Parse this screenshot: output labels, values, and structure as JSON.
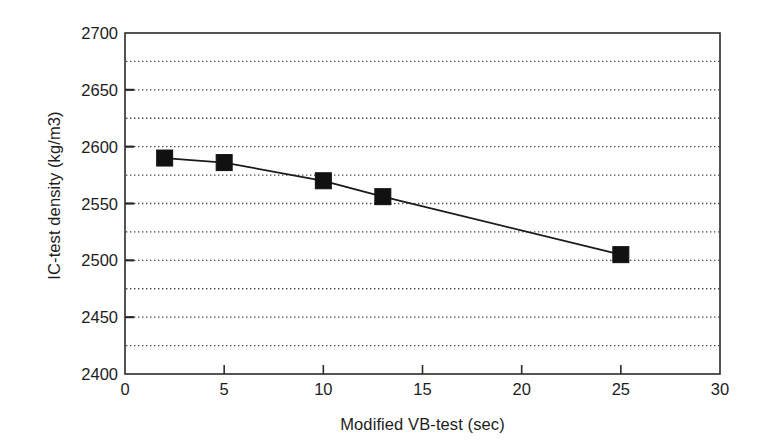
{
  "chart_data": {
    "type": "line",
    "title": "",
    "subtitle": "",
    "xlabel": "Modified VB-test (sec)",
    "ylabel": "IC-test density (kg/m3)",
    "xlim": [
      0,
      30
    ],
    "ylim": [
      2400,
      2700
    ],
    "x_ticks": [
      0,
      5,
      10,
      15,
      20,
      25,
      30
    ],
    "y_ticks": [
      2400,
      2450,
      2500,
      2550,
      2600,
      2650,
      2700
    ],
    "y_minor_gridlines": [
      2425,
      2450,
      2475,
      2500,
      2525,
      2550,
      2575,
      2600,
      2625,
      2650,
      2675
    ],
    "grid": "horizontal-dotted",
    "legend": "none",
    "marker": "filled-square",
    "line_color": "#1a1a1a",
    "marker_color": "#111111",
    "series": [
      {
        "name": "IC-test density vs Modified VB-test",
        "x": [
          2,
          5,
          10,
          13,
          25
        ],
        "values": [
          2590,
          2586,
          2570,
          2556,
          2505
        ]
      }
    ],
    "x_tick_labels": [
      "0",
      "5",
      "10",
      "15",
      "20",
      "25",
      "30"
    ],
    "y_tick_labels": [
      "2400",
      "2450",
      "2500",
      "2550",
      "2600",
      "2650",
      "2700"
    ]
  },
  "axes": {
    "y_title": "IC-test density (kg/m3)",
    "x_title": "Modified VB-test (sec)"
  }
}
